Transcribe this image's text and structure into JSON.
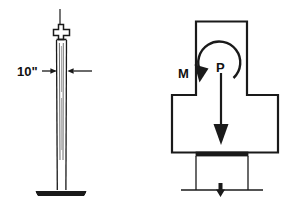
{
  "figure": {
    "background_color": "#ffffff",
    "line_color": "#1a1a1a",
    "panels": [
      {
        "name": "elevation-panel",
        "description": "Wide-flange steel column elevation with base plate and top cap detail",
        "dimension_label": "10\"",
        "parts": [
          "top-rod",
          "top-cap-bracket",
          "column-shaft",
          "base-plate"
        ]
      },
      {
        "name": "cross-section-panel",
        "description": "Cruciform (wide-flange) cross-section with applied axial load and moment",
        "parts": [
          "cross-section-outline",
          "moment-arc-arrow",
          "axial-load-arrow",
          "bearing-plate",
          "reaction-arrow"
        ],
        "load_labels": {
          "moment": "M",
          "axial": "P"
        }
      }
    ]
  }
}
